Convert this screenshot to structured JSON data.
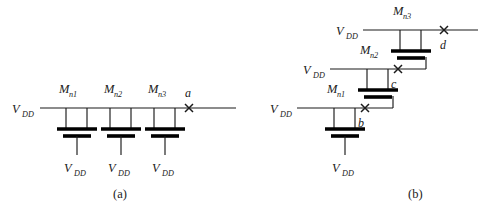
{
  "figure": {
    "background_color": "#ffffff",
    "line_color": "#1a1a1a",
    "bar_color": "#000000",
    "supply_label": "V",
    "supply_subscript": "DD",
    "device_prefix": "M",
    "node_marker": "x"
  },
  "panels": [
    {
      "id": "a",
      "caption": "(a)",
      "topology": "parallel-chain",
      "supply_inputs": [
        "V"
      ],
      "transistors": [
        {
          "name": "M",
          "subscript": "n1",
          "source_supply": "V",
          "source_supply_subscript": "DD"
        },
        {
          "name": "M",
          "subscript": "n2",
          "source_supply": "V",
          "source_supply_subscript": "DD"
        },
        {
          "name": "M",
          "subscript": "n3",
          "source_supply": "V",
          "source_supply_subscript": "DD"
        }
      ],
      "nodes": [
        {
          "label": "a",
          "marker": "x"
        }
      ],
      "rail_supply": {
        "label": "V",
        "subscript": "DD"
      }
    },
    {
      "id": "b",
      "caption": "(b)",
      "topology": "diagonal-cascade",
      "transistors": [
        {
          "name": "M",
          "subscript": "n1",
          "supply": "V",
          "supply_subscript": "DD",
          "source_supply": "V",
          "source_supply_subscript": "DD"
        },
        {
          "name": "M",
          "subscript": "n2",
          "supply": "V",
          "supply_subscript": "DD",
          "source_supply": null,
          "source_supply_subscript": null
        },
        {
          "name": "M",
          "subscript": "n3",
          "supply": "V",
          "supply_subscript": "DD",
          "source_supply": null,
          "source_supply_subscript": null
        }
      ],
      "nodes": [
        {
          "label": "b",
          "marker": "x"
        },
        {
          "label": "c",
          "marker": "x"
        },
        {
          "label": "d",
          "marker": "x"
        }
      ]
    }
  ]
}
